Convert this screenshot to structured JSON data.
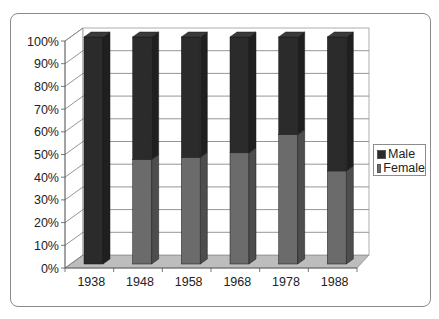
{
  "chart_data": {
    "type": "bar",
    "subtype": "3d-100%-stacked-column",
    "title": "",
    "xlabel": "",
    "ylabel": "",
    "categories": [
      "1938",
      "1948",
      "1958",
      "1968",
      "1978",
      "1988"
    ],
    "series": [
      {
        "name": "Female",
        "color": "#6b6b6b",
        "values": [
          0,
          46,
          47,
          49,
          57,
          41
        ]
      },
      {
        "name": "Male",
        "color": "#2b2b2b",
        "values": [
          100,
          54,
          53,
          51,
          43,
          59
        ]
      }
    ],
    "y_ticks": [
      "0%",
      "10%",
      "20%",
      "30%",
      "40%",
      "50%",
      "60%",
      "70%",
      "80%",
      "90%",
      "100%"
    ],
    "ylim": [
      0,
      100
    ],
    "grid": true,
    "legend_position": "right"
  },
  "legend": {
    "items": [
      {
        "label": "Male",
        "color": "#2b2b2b"
      },
      {
        "label": "Female",
        "color": "#6b6b6b"
      }
    ]
  }
}
